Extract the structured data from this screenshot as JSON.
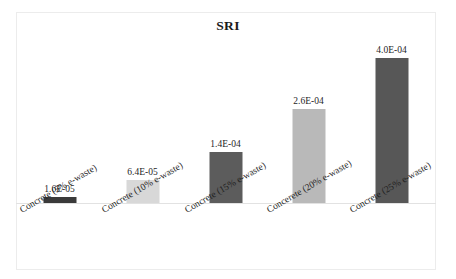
{
  "chart_data": {
    "type": "bar",
    "title": "SRI",
    "xlabel": "",
    "ylabel": "",
    "grid": false,
    "legend": "none",
    "axis_visible": false,
    "ylim": [
      0,
      0.00045
    ],
    "categories": [
      "Concrete (5% e-waste)",
      "Concrete (10% e-waste)",
      "Concrete (15% e-waste)",
      "Concerete (20% e-waste)",
      "Concrete (25% e-waste)"
    ],
    "values": [
      1.6e-05,
      6.4e-05,
      0.00014,
      0.00026,
      0.0004
    ],
    "data_labels": [
      "1.6E-05",
      "6.4E-05",
      "1.4E-04",
      "2.6E-04",
      "4.0E-04"
    ],
    "bar_colors": [
      "#3a3a3a",
      "#d8d8d8",
      "#5c5c5c",
      "#b9b9b9",
      "#575757"
    ]
  },
  "colors": {
    "background": "#ffffff",
    "frame": "#ececec",
    "text": "#1f1f1f",
    "title": "#1b1b1b"
  }
}
